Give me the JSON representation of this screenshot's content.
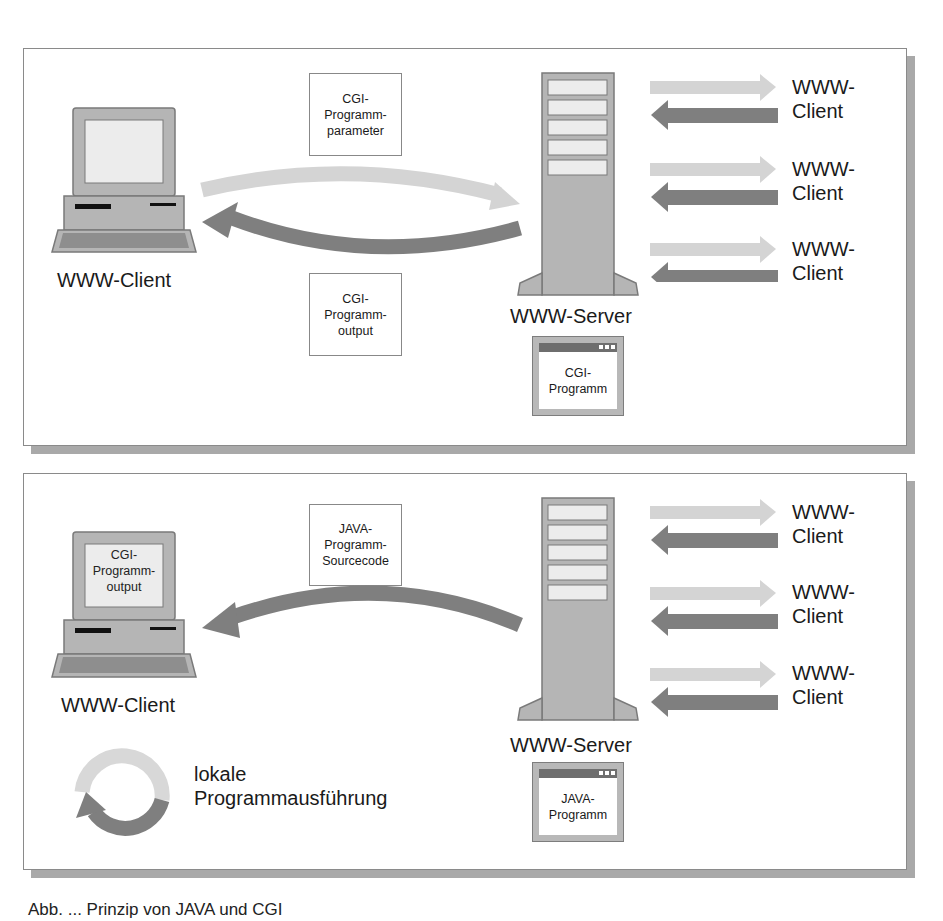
{
  "figure": {
    "caption": "Abb. ...  Prinzip von JAVA und CGI"
  },
  "colors": {
    "request_arrow": "#d4d4d4",
    "response_arrow": "#7f7f7f",
    "device_body": "#b5b5b5",
    "device_outline": "#7a7a7a",
    "screen": "#ececec",
    "panel_shadow": "#a9a9a9"
  },
  "panels": [
    {
      "id": "cgi",
      "client": {
        "label": "WWW-Client",
        "screen_text": []
      },
      "request_box": {
        "lines": [
          "CGI-",
          "Programm-",
          "parameter"
        ]
      },
      "response_box": {
        "lines": [
          "CGI-",
          "Programm-",
          "output"
        ]
      },
      "server": {
        "label": "WWW-Server",
        "program_window": {
          "lines": [
            "CGI-",
            "Programm"
          ]
        }
      },
      "remote_clients": [
        {
          "label_line1": "WWW-",
          "label_line2": "Client"
        },
        {
          "label_line1": "WWW-",
          "label_line2": "Client"
        },
        {
          "label_line1": "WWW-",
          "label_line2": "Client"
        }
      ]
    },
    {
      "id": "java",
      "client": {
        "label": "WWW-Client",
        "screen_text": [
          "CGI-",
          "Programm-",
          "output"
        ]
      },
      "transfer_box": {
        "lines": [
          "JAVA-",
          "Programm-",
          "Sourcecode"
        ]
      },
      "local_execution": {
        "line1": "lokale",
        "line2": "Programmausführung"
      },
      "server": {
        "label": "WWW-Server",
        "program_window": {
          "lines": [
            "JAVA-",
            "Programm"
          ]
        }
      },
      "remote_clients": [
        {
          "label_line1": "WWW-",
          "label_line2": "Client"
        },
        {
          "label_line1": "WWW-",
          "label_line2": "Client"
        },
        {
          "label_line1": "WWW-",
          "label_line2": "Client"
        }
      ]
    }
  ]
}
